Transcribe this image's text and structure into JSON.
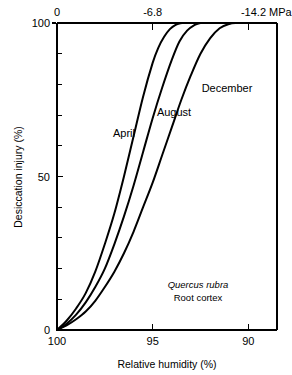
{
  "chart_data": {
    "type": "line",
    "title": "",
    "xlabel": "Relative humidity (%)",
    "ylabel": "Desiccation injury (%)",
    "x_axis": {
      "label": "Relative humidity (%)",
      "ticks": [
        100,
        95,
        90
      ],
      "tick_labels": [
        "100",
        "95",
        "90"
      ],
      "range": [
        100,
        88.5
      ],
      "reversed": true
    },
    "y_axis": {
      "label": "Desiccation injury (%)",
      "ticks": [
        0,
        50,
        100
      ],
      "tick_labels": [
        "0",
        "50",
        "100"
      ],
      "minor_tick_step": 10,
      "range": [
        0,
        100
      ]
    },
    "top_axis": {
      "label": "MPa",
      "ticks": [
        0,
        -6.8,
        -14.2
      ],
      "tick_labels": [
        "0",
        "-6.8",
        "-14.2 MPa"
      ],
      "tick_humidity": [
        100,
        95,
        90
      ]
    },
    "grid": false,
    "legend_position": "inline-curve-labels",
    "series": [
      {
        "name": "April",
        "label": "April",
        "x": [
          100,
          99.5,
          99,
          98.5,
          98,
          97.5,
          97,
          96.5,
          96,
          95.5,
          95,
          94.7,
          94.4,
          94.1,
          93.8,
          93.5
        ],
        "values": [
          0,
          3,
          7,
          12,
          19,
          28,
          38,
          50,
          63,
          76,
          87,
          92,
          95.5,
          98,
          99.4,
          100
        ]
      },
      {
        "name": "August",
        "label": "August",
        "x": [
          100,
          99.5,
          99,
          98.5,
          98,
          97.5,
          97,
          96.5,
          96,
          95.5,
          95,
          94.5,
          94,
          93.6,
          93.2,
          92.8,
          92.5
        ],
        "values": [
          0,
          2,
          5,
          9,
          14,
          20,
          28,
          37,
          47,
          58,
          69,
          79,
          88,
          94,
          97.5,
          99.4,
          100
        ]
      },
      {
        "name": "December",
        "label": "December",
        "x": [
          100,
          99.5,
          99,
          98.5,
          98,
          97.5,
          97,
          96.5,
          96,
          95.5,
          95,
          94.5,
          94,
          93.5,
          93,
          92.5,
          92,
          91.5,
          91,
          90.6
        ],
        "values": [
          0,
          1.5,
          3.5,
          6,
          9.5,
          14,
          19,
          25,
          32,
          40,
          48,
          57,
          66,
          75,
          83,
          90,
          95,
          98.3,
          99.7,
          100
        ]
      }
    ],
    "annotations": [
      {
        "text": "Quercus rubra",
        "style": "italic"
      },
      {
        "text": "Root cortex",
        "style": "plain"
      }
    ]
  }
}
